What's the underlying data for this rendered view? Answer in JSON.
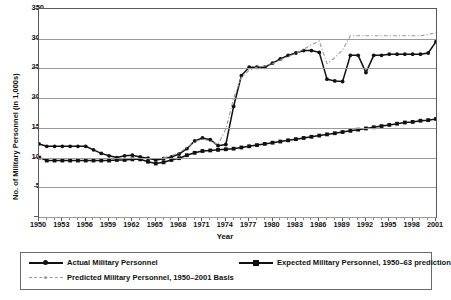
{
  "chart_data": {
    "type": "line",
    "title": "",
    "xlabel": "Year",
    "ylabel": "No. of Military Personnel (in 1,000s)",
    "xlim": [
      1950,
      2001
    ],
    "ylim": [
      0,
      350
    ],
    "yticks": [
      0,
      50,
      100,
      150,
      200,
      250,
      300,
      350
    ],
    "xticks": [
      1950,
      1953,
      1956,
      1959,
      1962,
      1965,
      1968,
      1971,
      1974,
      1977,
      1980,
      1983,
      1986,
      1989,
      1992,
      1995,
      1998,
      2001
    ],
    "grid": true,
    "legend_position": "below",
    "x": [
      1950,
      1951,
      1952,
      1953,
      1954,
      1955,
      1956,
      1957,
      1958,
      1959,
      1960,
      1961,
      1962,
      1963,
      1964,
      1965,
      1966,
      1967,
      1968,
      1969,
      1970,
      1971,
      1972,
      1973,
      1974,
      1975,
      1976,
      1977,
      1978,
      1979,
      1980,
      1981,
      1982,
      1983,
      1984,
      1985,
      1986,
      1987,
      1988,
      1989,
      1990,
      1991,
      1992,
      1993,
      1994,
      1995,
      1996,
      1997,
      1998,
      1999,
      2000,
      2001
    ],
    "series": [
      {
        "name": "Actual Military Personnel",
        "style": "solid-circle",
        "color": "#111111",
        "values": [
          123,
          119,
          119,
          119,
          119,
          119,
          119,
          113,
          107,
          103,
          100,
          103,
          104,
          101,
          99,
          96,
          98,
          101,
          106,
          115,
          128,
          133,
          130,
          120,
          122,
          186,
          238,
          252,
          252,
          252,
          259,
          266,
          272,
          276,
          280,
          280,
          277,
          232,
          229,
          228,
          272,
          272,
          243,
          272,
          272,
          274,
          274,
          274,
          274,
          274,
          276,
          295
        ]
      },
      {
        "name": "Expected Military Personnel, 1950-63 prediction",
        "style": "solid-square",
        "color": "#111111",
        "values": [
          100,
          95,
          95,
          95,
          95,
          95,
          95,
          95,
          95,
          95,
          96,
          96,
          97,
          97,
          93,
          90,
          92,
          96,
          99,
          104,
          108,
          111,
          112,
          113,
          114,
          115,
          117,
          119,
          121,
          123,
          125,
          127,
          129,
          131,
          133,
          135,
          137,
          139,
          141,
          143,
          145,
          147,
          149,
          151,
          153,
          155,
          157,
          159,
          160,
          162,
          163,
          165
        ]
      },
      {
        "name": "Predicted Military Personnel, 1950-2001 Basis",
        "style": "dash-dot",
        "color": "#9b9b9b",
        "values": [
          null,
          null,
          null,
          null,
          null,
          null,
          null,
          null,
          null,
          null,
          null,
          null,
          null,
          null,
          null,
          null,
          100,
          103,
          108,
          117,
          127,
          131,
          128,
          122,
          148,
          200,
          235,
          247,
          252,
          254,
          258,
          264,
          270,
          275,
          282,
          290,
          296,
          258,
          268,
          281,
          305,
          305,
          305,
          305,
          305,
          305,
          305,
          305,
          305,
          305,
          307,
          310
        ]
      }
    ]
  },
  "axis": {
    "ylabel": "No. of Military Personnel (in 1,000s)",
    "xlabel": "Year",
    "yticks": [
      "0",
      "50",
      "100",
      "150",
      "200",
      "250",
      "300",
      "350"
    ],
    "xticks": [
      "1950",
      "1953",
      "1956",
      "1959",
      "1962",
      "1965",
      "1968",
      "1971",
      "1974",
      "1977",
      "1980",
      "1983",
      "1986",
      "1989",
      "1992",
      "1995",
      "1998",
      "2001"
    ]
  },
  "legend": {
    "items": [
      {
        "label": "Actual Military Personnel",
        "marker": "circle-solid-line-icon"
      },
      {
        "label": "Expected Military Personnel, 1950–63 prediction",
        "marker": "square-solid-line-icon"
      },
      {
        "label": "Predicted Military Personnel, 1950–2001 Basis",
        "marker": "dash-dot-line-icon"
      }
    ]
  }
}
